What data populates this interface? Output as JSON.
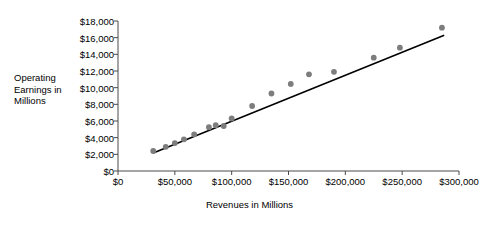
{
  "chart_data": {
    "type": "scatter",
    "title": "",
    "xlabel": "Revenues in Millions",
    "ylabel": "Operating Earnings in Millions",
    "ylabel_lines": [
      "Operating",
      "Earnings",
      "in Millions"
    ],
    "xlim": [
      0,
      300000
    ],
    "ylim": [
      0,
      18000
    ],
    "grid": false,
    "legend": null,
    "x_ticks": [
      0,
      50000,
      100000,
      150000,
      200000,
      250000,
      300000
    ],
    "x_tick_labels": [
      "$0",
      "$50,000",
      "$100,000",
      "$150,000",
      "$200,000",
      "$250,000",
      "$300,000"
    ],
    "y_ticks": [
      0,
      2000,
      4000,
      6000,
      8000,
      10000,
      12000,
      14000,
      16000,
      18000
    ],
    "y_tick_labels": [
      "$0",
      "$2,000",
      "$4,000",
      "$6,000",
      "$8,000",
      "$10,000",
      "$12,000",
      "$14,000",
      "$16,000",
      "$18,000"
    ],
    "point_color": "#7d7d7d",
    "line_color": "#000000",
    "axis_color": "#4a4a4a",
    "points": [
      {
        "x": 31000,
        "y": 2400
      },
      {
        "x": 42000,
        "y": 2900
      },
      {
        "x": 50000,
        "y": 3350
      },
      {
        "x": 58000,
        "y": 3800
      },
      {
        "x": 67000,
        "y": 4400
      },
      {
        "x": 80000,
        "y": 5250
      },
      {
        "x": 86000,
        "y": 5500
      },
      {
        "x": 93000,
        "y": 5400
      },
      {
        "x": 100000,
        "y": 6300
      },
      {
        "x": 118000,
        "y": 7800
      },
      {
        "x": 135000,
        "y": 9300
      },
      {
        "x": 152000,
        "y": 10450
      },
      {
        "x": 168000,
        "y": 11600
      },
      {
        "x": 190000,
        "y": 11900
      },
      {
        "x": 225000,
        "y": 13600
      },
      {
        "x": 248000,
        "y": 14800
      },
      {
        "x": 285000,
        "y": 17200
      }
    ],
    "trendline": {
      "x_start": 31000,
      "y_start": 2150,
      "x_end": 287000,
      "y_end": 16300
    }
  }
}
